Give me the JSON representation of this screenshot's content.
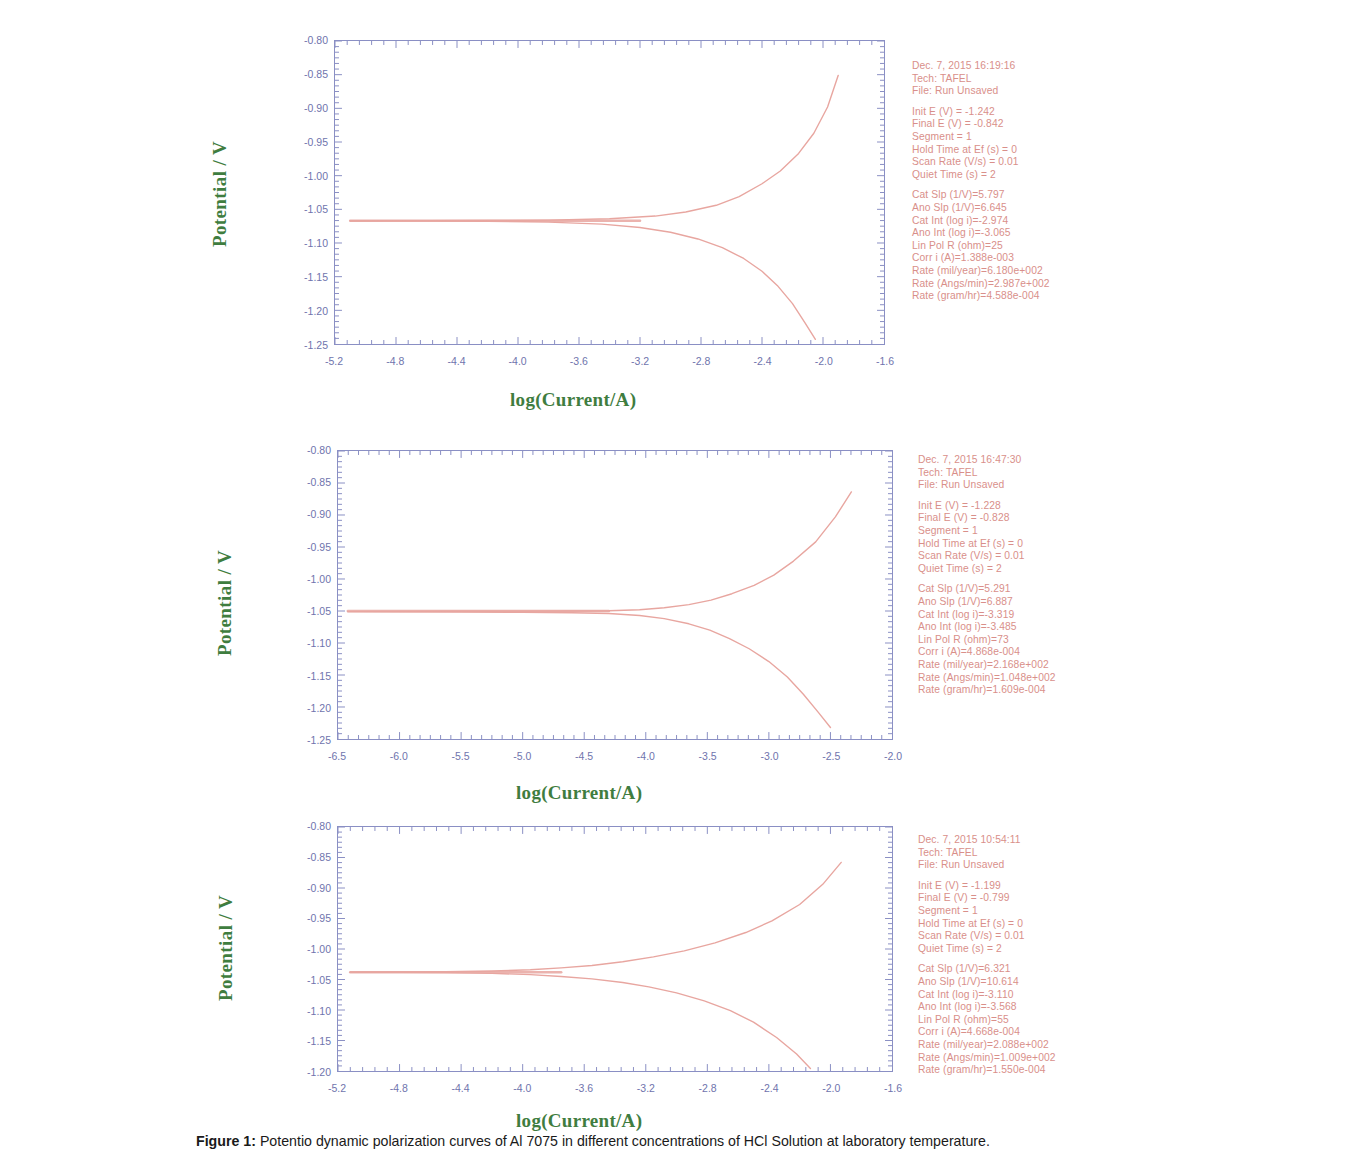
{
  "figure": {
    "caption_label": "Figure 1:",
    "caption_text": "Potentio dynamic polarization curves of Al 7075 in different concentrations of HCl Solution at laboratory temperature."
  },
  "axis_titles": {
    "y": "Potential / V",
    "x": "log(Current/A)"
  },
  "colors": {
    "axis": "#8a8fc4",
    "tick_text": "#6f74ad",
    "curve": "#e8a6a0",
    "info_text": "#d98f8a",
    "axis_title": "#3f7d3f"
  },
  "chart_data": [
    {
      "type": "line",
      "title": "Panel 1 - Tafel polarization, Dec. 7, 2015 16:19:16",
      "xlabel": "log(Current/A)",
      "ylabel": "Potential / V",
      "xlim": [
        -5.2,
        -1.6
      ],
      "ylim": [
        -1.25,
        -0.8
      ],
      "xticks": [
        "-5.2",
        "-4.8",
        "-4.4",
        "-4.0",
        "-3.6",
        "-3.2",
        "-2.8",
        "-2.4",
        "-2.0",
        "-1.6"
      ],
      "yticks": [
        "-0.80",
        "-0.85",
        "-0.90",
        "-0.95",
        "-1.00",
        "-1.05",
        "-1.10",
        "-1.15",
        "-1.20",
        "-1.25"
      ],
      "grid": false,
      "legend": "none",
      "ecorr": -1.067,
      "log_icorr": -3.02,
      "anodic_slope": 6.645,
      "cathodic_slope": 5.797,
      "anodic_branch": {
        "x": [
          -5.1,
          -4.6,
          -4.2,
          -3.8,
          -3.4,
          -3.1,
          -2.9,
          -2.7,
          -2.55,
          -2.4,
          -2.28,
          -2.16,
          -2.06,
          -1.97,
          -1.9
        ],
        "y": [
          -1.067,
          -1.0668,
          -1.0665,
          -1.066,
          -1.064,
          -1.06,
          -1.054,
          -1.044,
          -1.031,
          -1.012,
          -0.993,
          -0.967,
          -0.937,
          -0.898,
          -0.851
        ]
      },
      "cathodic_branch": {
        "x": [
          -5.1,
          -4.6,
          -4.2,
          -3.8,
          -3.45,
          -3.2,
          -3.0,
          -2.82,
          -2.66,
          -2.52,
          -2.4,
          -2.3,
          -2.2,
          -2.12,
          -2.05
        ],
        "y": [
          -1.067,
          -1.0672,
          -1.0676,
          -1.069,
          -1.072,
          -1.077,
          -1.084,
          -1.094,
          -1.107,
          -1.123,
          -1.142,
          -1.163,
          -1.19,
          -1.218,
          -1.243
        ]
      },
      "info": {
        "datetime": "Dec. 7, 2015   16:19:16",
        "tech": "Tech: TAFEL",
        "file": "File: Run Unsaved",
        "init_e": "Init E (V) = -1.242",
        "final_e": "Final E (V) = -0.842",
        "segment": "Segment = 1",
        "hold_time": "Hold Time at Ef (s) = 0",
        "scan_rate": "Scan Rate (V/s) = 0.01",
        "quiet_time": "Quiet Time (s) = 2",
        "cat_slp": "Cat Slp (1/V)=5.797",
        "ano_slp": "Ano Slp (1/V)=6.645",
        "cat_int": "Cat Int (log i)=-2.974",
        "ano_int": "Ano Int (log i)=-3.065",
        "lin_pol_r": "Lin Pol R (ohm)=25",
        "corr_i": "Corr i (A)=1.388e-003",
        "rate_mil": "Rate (mil/year)=6.180e+002",
        "rate_angs": "Rate (Angs/min)=2.987e+002",
        "rate_gram": "Rate (gram/hr)=4.588e-004"
      }
    },
    {
      "type": "line",
      "title": "Panel 2 - Tafel polarization, Dec. 7, 2015 16:47:30",
      "xlabel": "log(Current/A)",
      "ylabel": "Potential / V",
      "xlim": [
        -6.5,
        -2.0
      ],
      "ylim": [
        -1.25,
        -0.8
      ],
      "xticks": [
        "-6.5",
        "-6.0",
        "-5.5",
        "-5.0",
        "-4.5",
        "-4.0",
        "-3.5",
        "-3.0",
        "-2.5",
        "-2.0"
      ],
      "yticks": [
        "-0.80",
        "-0.85",
        "-0.90",
        "-0.95",
        "-1.00",
        "-1.05",
        "-1.10",
        "-1.15",
        "-1.20",
        "-1.25"
      ],
      "grid": false,
      "legend": "none",
      "ecorr": -1.05,
      "log_icorr": -3.4,
      "anodic_slope": 6.887,
      "cathodic_slope": 5.291,
      "anodic_branch": {
        "x": [
          -6.42,
          -6.0,
          -5.5,
          -5.0,
          -4.6,
          -4.3,
          -4.05,
          -3.85,
          -3.65,
          -3.47,
          -3.3,
          -3.12,
          -2.96,
          -2.8,
          -2.62,
          -2.46,
          -2.33
        ],
        "y": [
          -1.051,
          -1.0508,
          -1.0505,
          -1.0502,
          -1.05,
          -1.0495,
          -1.048,
          -1.045,
          -1.04,
          -1.033,
          -1.023,
          -1.01,
          -0.994,
          -0.972,
          -0.942,
          -0.903,
          -0.864
        ]
      },
      "cathodic_branch": {
        "x": [
          -6.42,
          -6.0,
          -5.5,
          -5.0,
          -4.6,
          -4.3,
          -4.05,
          -3.85,
          -3.65,
          -3.48,
          -3.32,
          -3.16,
          -3.0,
          -2.85,
          -2.72,
          -2.6,
          -2.5
        ],
        "y": [
          -1.051,
          -1.0512,
          -1.0515,
          -1.052,
          -1.0528,
          -1.054,
          -1.057,
          -1.062,
          -1.07,
          -1.08,
          -1.093,
          -1.109,
          -1.129,
          -1.153,
          -1.18,
          -1.208,
          -1.232
        ]
      },
      "info": {
        "datetime": "Dec. 7, 2015   16:47:30",
        "tech": "Tech: TAFEL",
        "file": "File: Run Unsaved",
        "init_e": "Init E (V) = -1.228",
        "final_e": "Final E (V) = -0.828",
        "segment": "Segment = 1",
        "hold_time": "Hold Time at Ef (s) = 0",
        "scan_rate": "Scan Rate (V/s) = 0.01",
        "quiet_time": "Quiet Time (s) = 2",
        "cat_slp": "Cat Slp (1/V)=5.291",
        "ano_slp": "Ano Slp (1/V)=6.887",
        "cat_int": "Cat Int (log i)=-3.319",
        "ano_int": "Ano Int (log i)=-3.485",
        "lin_pol_r": "Lin Pol R (ohm)=73",
        "corr_i": "Corr i (A)=4.868e-004",
        "rate_mil": "Rate (mil/year)=2.168e+002",
        "rate_angs": "Rate (Angs/min)=1.048e+002",
        "rate_gram": "Rate (gram/hr)=1.609e-004"
      }
    },
    {
      "type": "line",
      "title": "Panel 3 - Tafel polarization, Dec. 7, 2015 10:54:11",
      "xlabel": "log(Current/A)",
      "ylabel": "Potential / V",
      "xlim": [
        -5.2,
        -1.6
      ],
      "ylim": [
        -1.2,
        -0.8
      ],
      "xticks": [
        "-5.2",
        "-4.8",
        "-4.4",
        "-4.0",
        "-3.6",
        "-3.2",
        "-2.8",
        "-2.4",
        "-2.0",
        "-1.6"
      ],
      "yticks": [
        "-0.80",
        "-0.85",
        "-0.90",
        "-0.95",
        "-1.00",
        "-1.05",
        "-1.10",
        "-1.15",
        "-1.20"
      ],
      "grid": false,
      "legend": "none",
      "ecorr": -1.038,
      "log_icorr": -3.3,
      "anodic_slope": 10.614,
      "cathodic_slope": 6.321,
      "anodic_branch": {
        "x": [
          -5.12,
          -4.8,
          -4.5,
          -4.2,
          -3.95,
          -3.75,
          -3.55,
          -3.35,
          -3.15,
          -2.95,
          -2.75,
          -2.55,
          -2.38,
          -2.2,
          -2.05,
          -1.93
        ],
        "y": [
          -1.038,
          -1.0378,
          -1.0372,
          -1.036,
          -1.034,
          -1.031,
          -1.027,
          -1.021,
          -1.013,
          -1.003,
          -0.99,
          -0.973,
          -0.954,
          -0.927,
          -0.894,
          -0.858
        ]
      },
      "cathodic_branch": {
        "x": [
          -5.12,
          -4.8,
          -4.5,
          -4.2,
          -3.95,
          -3.75,
          -3.55,
          -3.35,
          -3.18,
          -3.0,
          -2.82,
          -2.65,
          -2.5,
          -2.35,
          -2.22,
          -2.13
        ],
        "y": [
          -1.038,
          -1.0382,
          -1.0388,
          -1.04,
          -1.042,
          -1.045,
          -1.049,
          -1.055,
          -1.062,
          -1.072,
          -1.085,
          -1.101,
          -1.12,
          -1.145,
          -1.172,
          -1.196
        ]
      },
      "info": {
        "datetime": "Dec. 7, 2015   10:54:11",
        "tech": "Tech: TAFEL",
        "file": "File: Run Unsaved",
        "init_e": "Init E (V) = -1.199",
        "final_e": "Final E (V) = -0.799",
        "segment": "Segment = 1",
        "hold_time": "Hold Time at Ef (s) = 0",
        "scan_rate": "Scan Rate (V/s) = 0.01",
        "quiet_time": "Quiet Time (s) = 2",
        "cat_slp": "Cat Slp (1/V)=6.321",
        "ano_slp": "Ano Slp (1/V)=10.614",
        "cat_int": "Cat Int (log i)=-3.110",
        "ano_int": "Ano Int (log i)=-3.568",
        "lin_pol_r": "Lin Pol R (ohm)=55",
        "corr_i": "Corr i (A)=4.668e-004",
        "rate_mil": "Rate (mil/year)=2.088e+002",
        "rate_angs": "Rate (Angs/min)=1.009e+002",
        "rate_gram": "Rate (gram/hr)=1.550e-004"
      }
    }
  ]
}
